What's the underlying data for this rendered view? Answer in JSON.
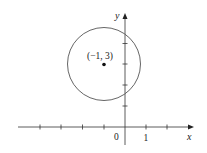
{
  "diagram": {
    "type": "coordinate-plane",
    "axes": {
      "x_label": "x",
      "y_label": "y",
      "origin_label": "0",
      "x_tick_label": "1",
      "x_ticks": [
        -4,
        -3,
        -2,
        -1,
        1,
        2
      ],
      "y_ticks": [
        1,
        2,
        3,
        4
      ]
    },
    "circle": {
      "center": [
        -1,
        3
      ],
      "radius": 1.732,
      "center_label": "(−1, 3)"
    },
    "colors": {
      "axis": "#333333",
      "circle": "#555555",
      "point": "#111111"
    }
  }
}
